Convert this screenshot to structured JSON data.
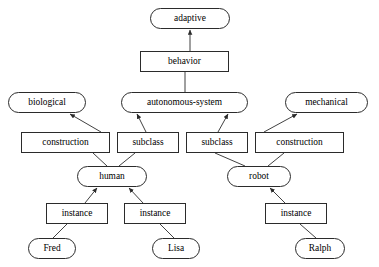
{
  "diagram": {
    "type": "semantic-network",
    "style": {
      "concept_shape": "rounded-rectangle",
      "relation_shape": "rectangle",
      "line_color": "#2b2b2b",
      "node_fill": "#ffffff",
      "text_color": "#000000"
    },
    "nodes": [
      {
        "id": "adaptive",
        "label": "adaptive",
        "kind": "concept",
        "x": 150,
        "y": 8,
        "w": 80,
        "h": 21
      },
      {
        "id": "behavior",
        "label": "behavior",
        "kind": "relation",
        "x": 140,
        "y": 51,
        "w": 89,
        "h": 21
      },
      {
        "id": "biological",
        "label": "biological",
        "kind": "concept",
        "x": 8,
        "y": 92,
        "w": 78,
        "h": 21
      },
      {
        "id": "autonomous-system",
        "label": "autonomous-system",
        "kind": "concept",
        "x": 121,
        "y": 92,
        "w": 127,
        "h": 21
      },
      {
        "id": "mechanical",
        "label": "mechanical",
        "kind": "concept",
        "x": 285,
        "y": 92,
        "w": 83,
        "h": 21
      },
      {
        "id": "construction-1",
        "label": "construction",
        "kind": "relation",
        "x": 21,
        "y": 132,
        "w": 89,
        "h": 21
      },
      {
        "id": "subclass-1",
        "label": "subclass",
        "kind": "relation",
        "x": 117,
        "y": 132,
        "w": 62,
        "h": 21
      },
      {
        "id": "subclass-2",
        "label": "subclass",
        "kind": "relation",
        "x": 186,
        "y": 132,
        "w": 62,
        "h": 21
      },
      {
        "id": "construction-2",
        "label": "construction",
        "kind": "relation",
        "x": 255,
        "y": 132,
        "w": 89,
        "h": 21
      },
      {
        "id": "human",
        "label": "human",
        "kind": "concept",
        "x": 77,
        "y": 166,
        "w": 70,
        "h": 21
      },
      {
        "id": "robot",
        "label": "robot",
        "kind": "concept",
        "x": 227,
        "y": 166,
        "w": 64,
        "h": 21
      },
      {
        "id": "instance-1",
        "label": "instance",
        "kind": "relation",
        "x": 46,
        "y": 203,
        "w": 62,
        "h": 21
      },
      {
        "id": "instance-2",
        "label": "instance",
        "kind": "relation",
        "x": 124,
        "y": 203,
        "w": 62,
        "h": 21
      },
      {
        "id": "instance-3",
        "label": "instance",
        "kind": "relation",
        "x": 265,
        "y": 203,
        "w": 62,
        "h": 21
      },
      {
        "id": "fred",
        "label": "Fred",
        "kind": "concept",
        "x": 28,
        "y": 238,
        "w": 48,
        "h": 21
      },
      {
        "id": "lisa",
        "label": "Lisa",
        "kind": "concept",
        "x": 152,
        "y": 238,
        "w": 48,
        "h": 21
      },
      {
        "id": "ralph",
        "label": "Ralph",
        "kind": "concept",
        "x": 295,
        "y": 238,
        "w": 50,
        "h": 21
      }
    ],
    "edges": [
      {
        "from": "behavior",
        "to": "adaptive",
        "x1": 190,
        "y1": 51,
        "x2": 190,
        "y2": 30,
        "arrow": true
      },
      {
        "from": "autonomous-system",
        "to": "behavior",
        "x1": 185,
        "y1": 92,
        "x2": 185,
        "y2": 72,
        "arrow": false
      },
      {
        "from": "construction-1",
        "to": "biological",
        "x1": 101,
        "y1": 132,
        "x2": 70,
        "y2": 114,
        "arrow": true
      },
      {
        "from": "subclass-1",
        "to": "autonomous-system",
        "x1": 146,
        "y1": 132,
        "x2": 137,
        "y2": 114,
        "arrow": true
      },
      {
        "from": "subclass-2",
        "to": "autonomous-system",
        "x1": 218,
        "y1": 132,
        "x2": 228,
        "y2": 114,
        "arrow": true
      },
      {
        "from": "construction-2",
        "to": "mechanical",
        "x1": 264,
        "y1": 132,
        "x2": 297,
        "y2": 114,
        "arrow": true
      },
      {
        "from": "construction-1",
        "to": "human",
        "x1": 93,
        "y1": 153,
        "x2": 107,
        "y2": 166,
        "arrow": false
      },
      {
        "from": "subclass-1",
        "to": "human",
        "x1": 135,
        "y1": 153,
        "x2": 119,
        "y2": 166,
        "arrow": false
      },
      {
        "from": "subclass-2",
        "to": "robot",
        "x1": 215,
        "y1": 153,
        "x2": 245,
        "y2": 166,
        "arrow": false
      },
      {
        "from": "construction-2",
        "to": "robot",
        "x1": 284,
        "y1": 153,
        "x2": 268,
        "y2": 166,
        "arrow": false
      },
      {
        "from": "instance-1",
        "to": "human",
        "x1": 85,
        "y1": 203,
        "x2": 97,
        "y2": 188,
        "arrow": true
      },
      {
        "from": "instance-2",
        "to": "human",
        "x1": 143,
        "y1": 203,
        "x2": 129,
        "y2": 188,
        "arrow": true
      },
      {
        "from": "instance-3",
        "to": "robot",
        "x1": 285,
        "y1": 203,
        "x2": 270,
        "y2": 188,
        "arrow": true
      },
      {
        "from": "instance-1",
        "to": "fred",
        "x1": 67,
        "y1": 224,
        "x2": 53,
        "y2": 238,
        "arrow": false
      },
      {
        "from": "instance-2",
        "to": "lisa",
        "x1": 160,
        "y1": 224,
        "x2": 174,
        "y2": 238,
        "arrow": false
      },
      {
        "from": "instance-3",
        "to": "ralph",
        "x1": 300,
        "y1": 224,
        "x2": 316,
        "y2": 238,
        "arrow": false
      }
    ]
  }
}
